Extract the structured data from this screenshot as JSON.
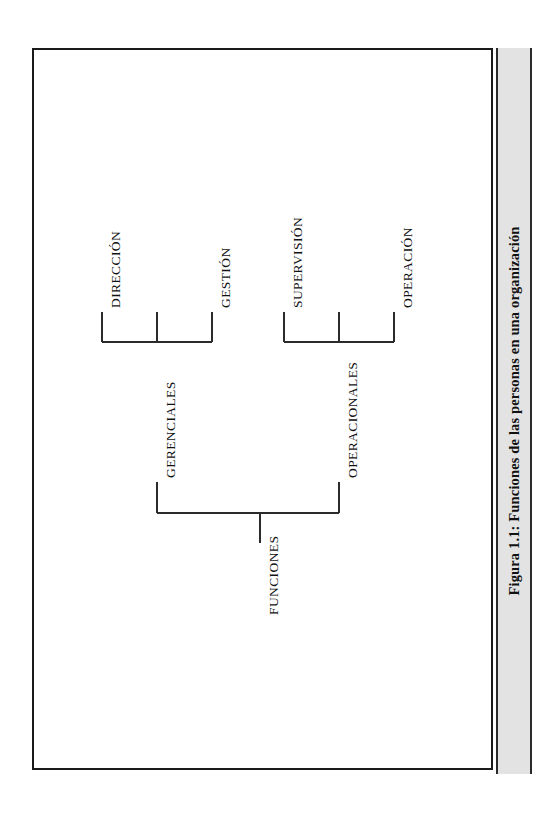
{
  "page": {
    "background_color": "#ffffff",
    "frame_color": "#1a1a1a",
    "caption_strip_color": "#e3e3e3"
  },
  "caption": {
    "text": "Figura 1.1: Funciones de las personas en una organización",
    "label": "Figura 1.1:",
    "title": "Funciones de las personas en una organización"
  },
  "diagram": {
    "type": "tree",
    "orientation": "rotated-90-ccw",
    "root": {
      "label": "FUNCIONES",
      "children": [
        {
          "label": "GERENCIALES",
          "children": [
            {
              "label": "DIRECCIÓN"
            },
            {
              "label": "GESTIÓN"
            }
          ]
        },
        {
          "label": "OPERACIONALES",
          "children": [
            {
              "label": "SUPERVISIÓN"
            },
            {
              "label": "OPERACIÓN"
            }
          ]
        }
      ]
    },
    "nodes": {
      "root": "FUNCIONES",
      "branch_left": "GERENCIALES",
      "branch_right": "OPERACIONALES",
      "leaf_1": "DIRECCIÓN",
      "leaf_2": "GESTIÓN",
      "leaf_3": "SUPERVISIÓN",
      "leaf_4": "OPERACIÓN"
    },
    "line_color": "#2b2b2b"
  }
}
